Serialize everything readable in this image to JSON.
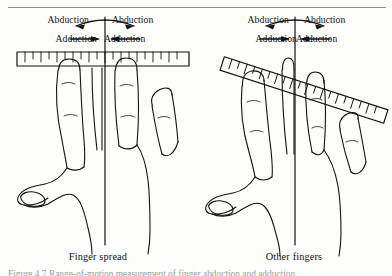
{
  "figure": {
    "top_rule": true,
    "caption_line": "Figure 4.7  Range-of-motion measurement of finger abduction and adduction.",
    "ink_color": "#141210",
    "rule_color": "#8d8d8d",
    "background": "#fdfdfc"
  },
  "panels": [
    {
      "id": "finger-spread",
      "caption": "Finger spread",
      "axis_x": 105,
      "ruler": {
        "type": "goniometer-ruler",
        "orientation": "horizontal",
        "angle_deg": 0,
        "tick_count": 20
      },
      "labels": {
        "abduction_left": "Abduction",
        "abduction_right": "Abduction",
        "adduction_left": "Adduction",
        "adduction_right": "Adduction"
      },
      "arrows": {
        "abduction_direction": "outward",
        "adduction_direction": "inward"
      }
    },
    {
      "id": "other-fingers",
      "caption": "Other fingers",
      "axis_x": 99,
      "ruler": {
        "type": "goniometer-ruler",
        "orientation": "tilted",
        "angle_deg": 18,
        "tick_count": 20
      },
      "labels": {
        "abduction_left": "Abduction",
        "abduction_right": "Abduction",
        "adduction_left": "Adduction",
        "adduction_right": "Adduction"
      },
      "arrows": {
        "abduction_direction": "outward",
        "adduction_direction": "inward"
      }
    }
  ]
}
